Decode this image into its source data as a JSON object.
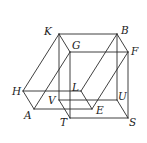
{
  "diagram": {
    "type": "geometry-solid",
    "vertices": {
      "K": {
        "x": 59,
        "y": 34,
        "label": "K",
        "lx": 44,
        "ly": 35
      },
      "B": {
        "x": 117,
        "y": 34,
        "label": "B",
        "lx": 121,
        "ly": 34
      },
      "G": {
        "x": 70,
        "y": 52,
        "label": "G",
        "lx": 72,
        "ly": 49
      },
      "F": {
        "x": 128,
        "y": 52,
        "label": "F",
        "lx": 131,
        "ly": 55
      },
      "H": {
        "x": 23,
        "y": 91,
        "label": "H",
        "lx": 12,
        "ly": 95
      },
      "L": {
        "x": 81,
        "y": 91,
        "label": "L",
        "lx": 72,
        "ly": 91
      },
      "A": {
        "x": 34,
        "y": 109,
        "label": "A",
        "lx": 24,
        "ly": 119
      },
      "E": {
        "x": 92,
        "y": 109,
        "label": "E",
        "lx": 96,
        "ly": 114
      },
      "V": {
        "x": 59,
        "y": 100,
        "label": "V",
        "lx": 48,
        "ly": 104
      },
      "U": {
        "x": 117,
        "y": 100,
        "label": "U",
        "lx": 118,
        "ly": 100
      },
      "T": {
        "x": 70,
        "y": 118,
        "label": "T",
        "lx": 60,
        "ly": 126
      },
      "S": {
        "x": 128,
        "y": 118,
        "label": "S",
        "lx": 129,
        "ly": 126
      }
    },
    "edges": [
      [
        "K",
        "B"
      ],
      [
        "B",
        "F"
      ],
      [
        "F",
        "G"
      ],
      [
        "G",
        "K"
      ],
      [
        "V",
        "U"
      ],
      [
        "U",
        "S"
      ],
      [
        "S",
        "T"
      ],
      [
        "T",
        "V"
      ],
      [
        "K",
        "V"
      ],
      [
        "B",
        "U"
      ],
      [
        "F",
        "S"
      ],
      [
        "G",
        "T"
      ],
      [
        "H",
        "L"
      ],
      [
        "L",
        "E"
      ],
      [
        "E",
        "A"
      ],
      [
        "A",
        "H"
      ],
      [
        "K",
        "H"
      ],
      [
        "G",
        "A"
      ],
      [
        "B",
        "L"
      ],
      [
        "F",
        "E"
      ]
    ],
    "stroke_color": "#2a2a2a"
  }
}
